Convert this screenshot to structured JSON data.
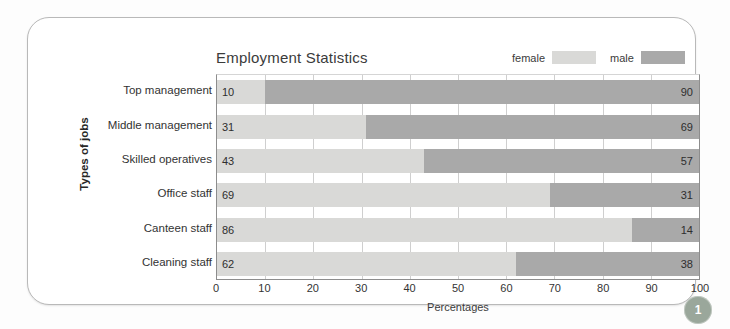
{
  "page": {
    "badge_number": "1"
  },
  "chart_data": {
    "type": "bar",
    "orientation": "horizontal",
    "stacked": true,
    "title": "Employment Statistics",
    "xlabel": "Percentages",
    "ylabel": "Types of jobs",
    "xlim": [
      0,
      100
    ],
    "xticks": [
      0,
      10,
      20,
      30,
      40,
      50,
      60,
      70,
      80,
      90,
      100
    ],
    "grid": true,
    "legend_position": "top-right",
    "categories": [
      "Top management",
      "Middle management",
      "Skilled operatives",
      "Office staff",
      "Canteen staff",
      "Cleaning staff"
    ],
    "series": [
      {
        "name": "female",
        "color": "#d9d9d7",
        "values": [
          10,
          31,
          43,
          69,
          86,
          62
        ]
      },
      {
        "name": "male",
        "color": "#a9a9a9",
        "values": [
          90,
          69,
          57,
          31,
          14,
          38
        ]
      }
    ]
  }
}
